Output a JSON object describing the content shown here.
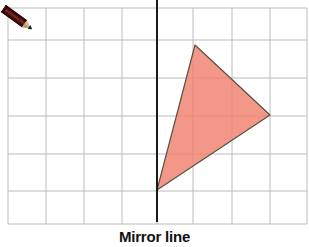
{
  "canvas": {
    "width": 309,
    "height": 247,
    "background": "#ffffff"
  },
  "caption": {
    "text": "Mirror line"
  },
  "pencil_icon": {
    "name": "pencil-icon",
    "barrel_color": "#5a1216",
    "stripe_color": "#2b0a0c",
    "wood_color": "#d8bb8a",
    "tip_color": "#1d1a17",
    "x": 5,
    "y": 4,
    "width": 33,
    "height": 30
  },
  "grid": {
    "line_color": "#bcbcbc",
    "line_width": 1,
    "left": 8,
    "right": 307,
    "top": 8,
    "bottom": 224,
    "x_lines": [
      8,
      46,
      84,
      122,
      157,
      193,
      232,
      270,
      307
    ],
    "y_lines": [
      8,
      40,
      78,
      116,
      154,
      191,
      224
    ]
  },
  "mirror_line": {
    "label": "Mirror line",
    "color": "#1a1a1a",
    "width": 2,
    "x": 157,
    "y_start": 0,
    "y_end": 222
  },
  "shape": {
    "name": "triangle",
    "fill": "#f0816f",
    "fill_opacity": 0.82,
    "stroke": "#595040",
    "stroke_width": 1.2,
    "points": "195,45 270,115 157,190",
    "vertices": [
      {
        "label": "top",
        "x": 195,
        "y": 45
      },
      {
        "label": "right",
        "x": 270,
        "y": 115
      },
      {
        "label": "bottom",
        "x": 157,
        "y": 190
      }
    ]
  },
  "chart_data": {
    "type": "scatter",
    "title": "Mirror line",
    "xlabel": "",
    "ylabel": "",
    "series": [
      {
        "name": "triangle",
        "x": [
          195,
          270,
          157
        ],
        "y": [
          45,
          115,
          190
        ]
      }
    ],
    "annotations": [
      "Mirror line"
    ],
    "grid": true,
    "legend": "none",
    "xlim": [
      8,
      307
    ],
    "ylim": [
      8,
      224
    ]
  }
}
